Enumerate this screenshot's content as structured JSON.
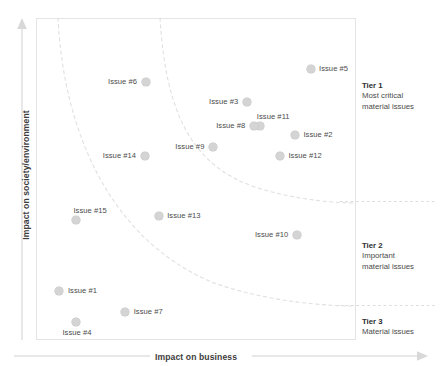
{
  "chart_data": {
    "type": "scatter",
    "title": "",
    "subtitle": "",
    "xlabel": "Impact on business",
    "ylabel": "Impact on society/environment",
    "xlim": [
      0,
      100
    ],
    "ylim": [
      0,
      100
    ],
    "grid": false,
    "legend_position": "none",
    "axis_style": "arrow",
    "point_color": "#d4d4d4",
    "curve_color": "#dcdcdc",
    "frame_color": "#e2e2e2",
    "points": [
      {
        "label": "Issue #5",
        "x": 85.9,
        "y": 84.4,
        "label_side": "right"
      },
      {
        "label": "Issue #6",
        "x": 34.2,
        "y": 80.1,
        "label_side": "left"
      },
      {
        "label": "Issue #3",
        "x": 65.9,
        "y": 73.9,
        "label_side": "left"
      },
      {
        "label": "Issue #11",
        "x": 70.0,
        "y": 66.4,
        "label_side": "top"
      },
      {
        "label": "Issue #8",
        "x": 68.1,
        "y": 66.4,
        "label_side": "left"
      },
      {
        "label": "Issue #2",
        "x": 81.0,
        "y": 63.6,
        "label_side": "right"
      },
      {
        "label": "Issue #9",
        "x": 55.3,
        "y": 60.1,
        "label_side": "left"
      },
      {
        "label": "Issue #12",
        "x": 76.3,
        "y": 57.3,
        "label_side": "right"
      },
      {
        "label": "Issue #14",
        "x": 33.9,
        "y": 57.3,
        "label_side": "left"
      },
      {
        "label": "Issue #13",
        "x": 38.3,
        "y": 38.5,
        "label_side": "right"
      },
      {
        "label": "Issue #15",
        "x": 12.5,
        "y": 37.2,
        "label_side": "top"
      },
      {
        "label": "Issue #10",
        "x": 81.6,
        "y": 32.6,
        "label_side": "left"
      },
      {
        "label": "Issue #1",
        "x": 7.2,
        "y": 15.2,
        "label_side": "right"
      },
      {
        "label": "Issue #7",
        "x": 27.8,
        "y": 8.7,
        "label_side": "right"
      },
      {
        "label": "Issue #4",
        "x": 12.5,
        "y": 5.3,
        "label_side": "bottom"
      }
    ],
    "tier_curves": [
      {
        "name": "tier-1-boundary",
        "description": "dashed hyperbolic boundary separating Tier 1 from Tier 2"
      },
      {
        "name": "tier-2-boundary",
        "description": "dashed hyperbolic boundary separating Tier 2 from Tier 3"
      }
    ]
  },
  "axes": {
    "x_title": "Impact on business",
    "y_title": "Impact on society/environment"
  },
  "tiers": [
    {
      "id": "tier-1",
      "title": "Tier 1",
      "line1": "Most critical",
      "line2": "material issues"
    },
    {
      "id": "tier-2",
      "title": "Tier 2",
      "line1": "Important",
      "line2": "material issues"
    },
    {
      "id": "tier-3",
      "title": "Tier 3",
      "line1": "Material issues",
      "line2": ""
    }
  ]
}
